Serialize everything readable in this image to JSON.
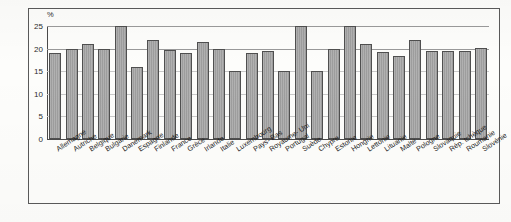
{
  "chart_data": {
    "type": "bar",
    "title": "",
    "subtitle": "",
    "xlabel": "",
    "ylabel": "%",
    "ylim": [
      0,
      25
    ],
    "yticks": [
      0,
      5,
      10,
      15,
      20,
      25
    ],
    "ytick_labels": [
      "0",
      "5",
      "10",
      "15",
      "20",
      "25"
    ],
    "grid": true,
    "legend": false,
    "categories": [
      "Allemagne",
      "Autriche",
      "Belgique",
      "Bulgarie",
      "Danemark",
      "Espagne",
      "Finlande",
      "France",
      "Grèce",
      "Irlande",
      "Italie",
      "Luxembourg",
      "Pays- Bas",
      "Royaume- Uni",
      "Portugal",
      "Suède",
      "Chypre",
      "Estonie",
      "Hongrie",
      "Lettonie",
      "Lituanie",
      "Malte",
      "Pologne",
      "Slovaquie",
      "Rép. tchèque",
      "Roumanie",
      "Slovénie"
    ],
    "values": [
      19.0,
      20.0,
      21.0,
      20.0,
      25.0,
      16.0,
      22.0,
      19.7,
      19.1,
      21.5,
      20.0,
      15.0,
      19.1,
      19.5,
      15.1,
      25.0,
      15.1,
      20.0,
      25.0,
      21.0,
      19.2,
      18.3,
      22.0,
      19.5,
      19.4,
      19.4,
      20.2
    ]
  },
  "axis": {
    "unit_label": "%"
  }
}
